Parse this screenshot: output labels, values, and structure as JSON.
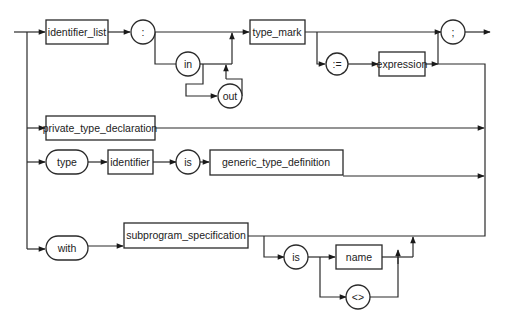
{
  "diagram": {
    "type": "syntax-diagram",
    "colors": {
      "line": "#2a2a2a",
      "background": "#ffffff",
      "text": "#222222"
    },
    "nodes": {
      "identifier_list": "identifier_list",
      "colon": ":",
      "in": "in",
      "out": "out",
      "type_mark": "type_mark",
      "assign": ":=",
      "expression": "expression",
      "semicolon": ";",
      "private_type_declaration": "private_type_declaration",
      "type_kw": "type",
      "identifier": "identifier",
      "is_kw_1": "is",
      "generic_type_definition": "generic_type_definition",
      "with_kw": "with",
      "subprogram_specification": "subprogram_specification",
      "is_kw_2": "is",
      "name": "name",
      "box": "<>"
    }
  }
}
